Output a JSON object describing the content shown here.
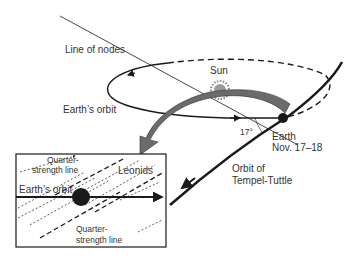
{
  "diagram": {
    "labels": {
      "line_of_nodes": "Line of nodes",
      "sun": "Sun",
      "earths_orbit": "Earth’s orbit",
      "angle": "17°",
      "earth": "Earth",
      "earth_date": "Nov. 17–18",
      "comet_orbit_1": "Orbit of",
      "comet_orbit_2": "Tempel-Tuttle"
    },
    "inset": {
      "quarter_top_1": "Quarter-",
      "quarter_top_2": "strength line",
      "leonids": "Leonids",
      "earths_orbit": "Earth’s orbit",
      "quarter_bottom_1": "Quarter-",
      "quarter_bottom_2": "strength line"
    },
    "colors": {
      "ink": "#1a1a1a",
      "arrow_fill": "#6b6b6b",
      "sun_fill": "#9a9a9a"
    }
  }
}
